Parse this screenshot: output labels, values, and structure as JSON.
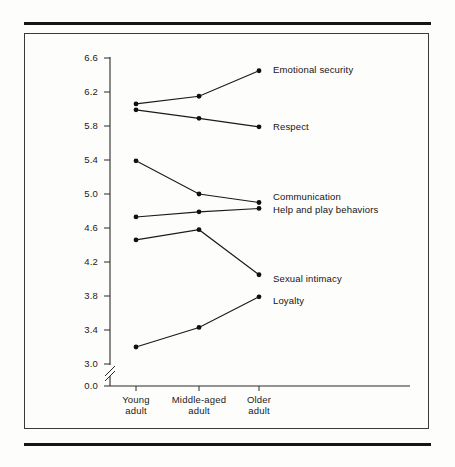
{
  "figure": {
    "background_color": "#fdfdfb",
    "line_color": "#1a1a1a",
    "marker_color": "#101010",
    "rule_top_label": "top-rule",
    "rule_bottom_label": "bottom-rule"
  },
  "chart_data": {
    "type": "line",
    "title": "",
    "xlabel": "",
    "ylabel": "",
    "categories": [
      "Young adult",
      "Middle-aged adult",
      "Older adult"
    ],
    "category_lines": [
      [
        "Young",
        "adult"
      ],
      [
        "Middle-aged",
        "adult"
      ],
      [
        "Older",
        "adult"
      ]
    ],
    "ylim": [
      3.0,
      6.6
    ],
    "yticks": [
      "6.6",
      "6.2",
      "5.8",
      "5.4",
      "5.0",
      "4.6",
      "4.2",
      "3.8",
      "3.4",
      "3.0",
      "0.0"
    ],
    "ytick_values": [
      6.6,
      6.2,
      5.8,
      5.4,
      5.0,
      4.6,
      4.2,
      3.8,
      3.4,
      3.0,
      0.0
    ],
    "axis_break": true,
    "axis_break_between": [
      3.0,
      0.0
    ],
    "grid": false,
    "legend_position": "right-inline",
    "series": [
      {
        "name": "Emotional security",
        "values": [
          6.06,
          6.15,
          6.45
        ]
      },
      {
        "name": "Respect",
        "values": [
          5.99,
          5.89,
          5.79
        ]
      },
      {
        "name": "Communication",
        "values": [
          5.39,
          5.0,
          4.9
        ]
      },
      {
        "name": "Help and play behaviors",
        "values": [
          4.73,
          4.79,
          4.83
        ]
      },
      {
        "name": "Sexual intimacy",
        "values": [
          4.46,
          4.58,
          4.05
        ]
      },
      {
        "name": "Loyalty",
        "values": [
          3.2,
          3.43,
          3.79
        ]
      }
    ]
  },
  "series_labels": {
    "emotional_security": "Emotional security",
    "respect": "Respect",
    "communication": "Communication",
    "help_and_play": "Help and play behaviors",
    "sexual_intimacy": "Sexual intimacy",
    "loyalty": "Loyalty"
  },
  "yticks": {
    "t0": "6.6",
    "t1": "6.2",
    "t2": "5.8",
    "t3": "5.4",
    "t4": "5.0",
    "t5": "4.6",
    "t6": "4.2",
    "t7": "3.8",
    "t8": "3.4",
    "t9": "3.0",
    "t10": "0.0"
  },
  "xticks": {
    "c0_line1": "Young",
    "c0_line2": "adult",
    "c1_line1": "Middle-aged",
    "c1_line2": "adult",
    "c2_line1": "Older",
    "c2_line2": "adult"
  }
}
